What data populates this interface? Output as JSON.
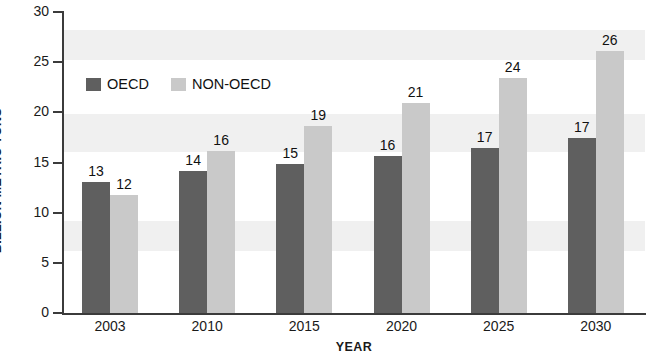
{
  "chart_data": {
    "type": "bar",
    "title": "",
    "xlabel": "YEAR",
    "ylabel": "BILLION METRIC TONS",
    "categories": [
      "2003",
      "2010",
      "2015",
      "2020",
      "2025",
      "2030"
    ],
    "series": [
      {
        "name": "OECD",
        "color": "#5f5f5f",
        "values": [
          13,
          14,
          15,
          16,
          17,
          17
        ],
        "plotted_values": [
          13.1,
          14.2,
          14.9,
          15.6,
          16.4,
          17.4
        ],
        "labels": [
          "13",
          "14",
          "15",
          "16",
          "17",
          "17"
        ]
      },
      {
        "name": "NON-OECD",
        "color": "#c9c9c9",
        "values": [
          12,
          16,
          19,
          21,
          24,
          26
        ],
        "plotted_values": [
          11.8,
          16.1,
          18.6,
          20.9,
          23.4,
          26.1
        ],
        "labels": [
          "12",
          "16",
          "19",
          "21",
          "24",
          "26"
        ]
      }
    ],
    "ylim": [
      0,
      30
    ],
    "yticks": [
      0,
      5,
      10,
      15,
      20,
      25,
      30
    ],
    "ytick_labels": [
      "0",
      "5",
      "10",
      "15",
      "20",
      "25",
      "30"
    ],
    "grid": false,
    "background_bands": true,
    "legend_position": "top-left-inside"
  },
  "legend": {
    "items": [
      {
        "label": "OECD",
        "color": "#5f5f5f"
      },
      {
        "label": "NON-OECD",
        "color": "#c9c9c9"
      }
    ]
  },
  "axes": {
    "y_title": "BILLION METRIC TONS",
    "x_title": "YEAR"
  },
  "colors": {
    "oecd": "#5f5f5f",
    "nonoecd": "#c9c9c9",
    "axis": "#3b3b3b",
    "band": "#f0f0f0",
    "text": "#1a1a1a",
    "background": "#ffffff"
  }
}
